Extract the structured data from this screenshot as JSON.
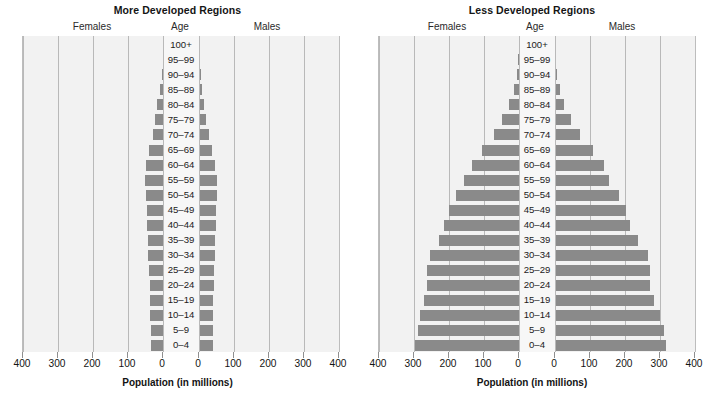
{
  "figure": {
    "xaxis_title": "Population (in millions)",
    "column_headers": {
      "females": "Females",
      "age": "Age",
      "males": "Males"
    },
    "tick_labels": [
      "400",
      "300",
      "200",
      "100",
      "0",
      "0",
      "100",
      "200",
      "300",
      "400"
    ],
    "age_groups": [
      "100+",
      "95–99",
      "90–94",
      "85–89",
      "80–84",
      "75–79",
      "70–74",
      "65–69",
      "60–64",
      "55–59",
      "50–54",
      "45–49",
      "40–44",
      "35–39",
      "30–34",
      "25–29",
      "20–24",
      "15–19",
      "10–14",
      "5–9",
      "0–4"
    ],
    "bar_color": "#8a8a8a",
    "plot_background": "#f2f2f2",
    "gridline_color": "#b9b9b9"
  },
  "chart_data": [
    {
      "type": "bar",
      "title": "More Developed Regions",
      "subtype": "population-pyramid",
      "xlabel": "Population (in millions)",
      "ylabel": "Age",
      "xlim": [
        -400,
        400
      ],
      "xticks": [
        400,
        300,
        200,
        100,
        0,
        0,
        100,
        200,
        300,
        400
      ],
      "grid": true,
      "legend": "none",
      "categories": [
        "100+",
        "95–99",
        "90–94",
        "85–89",
        "80–84",
        "75–79",
        "70–74",
        "65–69",
        "60–64",
        "55–59",
        "50–54",
        "45–49",
        "40–44",
        "35–39",
        "30–34",
        "25–29",
        "20–24",
        "15–19",
        "10–14",
        "5–9",
        "0–4"
      ],
      "series": [
        {
          "name": "Females",
          "side": "left",
          "values": [
            0,
            1,
            4,
            9,
            16,
            23,
            30,
            40,
            48,
            52,
            50,
            47,
            45,
            44,
            43,
            41,
            38,
            36,
            36,
            35,
            35
          ]
        },
        {
          "name": "Males",
          "side": "right",
          "values": [
            0,
            0,
            2,
            5,
            10,
            17,
            25,
            35,
            44,
            49,
            48,
            46,
            45,
            44,
            43,
            41,
            39,
            38,
            38,
            37,
            37
          ]
        }
      ]
    },
    {
      "type": "bar",
      "title": "Less Developed Regions",
      "subtype": "population-pyramid",
      "xlabel": "Population (in millions)",
      "ylabel": "Age",
      "xlim": [
        -400,
        400
      ],
      "xticks": [
        400,
        300,
        200,
        100,
        0,
        0,
        100,
        200,
        300,
        400
      ],
      "grid": true,
      "legend": "none",
      "categories": [
        "100+",
        "95–99",
        "90–94",
        "85–89",
        "80–84",
        "75–79",
        "70–74",
        "65–69",
        "60–64",
        "55–59",
        "50–54",
        "45–49",
        "40–44",
        "35–39",
        "30–34",
        "25–29",
        "20–24",
        "15–19",
        "10–14",
        "5–9",
        "0–4"
      ],
      "series": [
        {
          "name": "Females",
          "side": "left",
          "values": [
            0,
            2,
            6,
            15,
            28,
            48,
            72,
            105,
            135,
            158,
            180,
            200,
            215,
            230,
            255,
            262,
            262,
            272,
            282,
            290,
            297
          ]
        },
        {
          "name": "Males",
          "side": "right",
          "values": [
            0,
            1,
            4,
            11,
            22,
            42,
            68,
            105,
            138,
            152,
            180,
            200,
            210,
            235,
            262,
            268,
            268,
            280,
            297,
            308,
            313
          ]
        }
      ]
    }
  ]
}
